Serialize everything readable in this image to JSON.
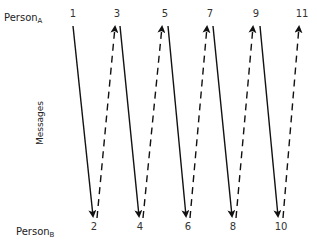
{
  "diagram": {
    "type": "message-sequence",
    "person_a": {
      "name": "Person",
      "subscript": "A"
    },
    "person_b": {
      "name": "Person",
      "subscript": "B"
    },
    "axis_label": "Messages",
    "top_labels": [
      "1",
      "3",
      "5",
      "7",
      "9",
      "11"
    ],
    "bottom_labels": [
      "2",
      "4",
      "6",
      "8",
      "10"
    ],
    "messages": [
      {
        "id": 1,
        "from": "A",
        "to": "B",
        "style": "solid"
      },
      {
        "id": 2,
        "from": "B",
        "to": "A",
        "style": "dashed"
      },
      {
        "id": 3,
        "from": "A",
        "to": "B",
        "style": "solid"
      },
      {
        "id": 4,
        "from": "B",
        "to": "A",
        "style": "dashed"
      },
      {
        "id": 5,
        "from": "A",
        "to": "B",
        "style": "solid"
      },
      {
        "id": 6,
        "from": "B",
        "to": "A",
        "style": "dashed"
      },
      {
        "id": 7,
        "from": "A",
        "to": "B",
        "style": "solid"
      },
      {
        "id": 8,
        "from": "B",
        "to": "A",
        "style": "dashed"
      },
      {
        "id": 9,
        "from": "A",
        "to": "B",
        "style": "solid"
      },
      {
        "id": 10,
        "from": "B",
        "to": "A",
        "style": "dashed"
      }
    ]
  }
}
